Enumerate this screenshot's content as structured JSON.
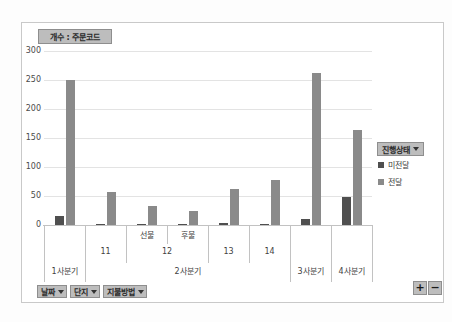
{
  "colors": {
    "undelivered": "#4f4f4f",
    "delivered": "#8a8a8a",
    "button_bg": "#bdbdbd",
    "button_border": "#8e8e8e",
    "gridline": "#e3e3e3",
    "axis_line": "#c2c2c2",
    "frame_border": "#c9c9c9"
  },
  "value_field_button": {
    "label": "개수 : 주문코드"
  },
  "chart_data": {
    "type": "bar",
    "title": "개수 : 주문코드",
    "xlabel": "",
    "ylabel": "",
    "ylim": [
      0,
      300
    ],
    "yticks": [
      300,
      250,
      200,
      150,
      100,
      50,
      0
    ],
    "grid": true,
    "legend_position": "right",
    "categories": [
      "1사분기",
      "11",
      "선불",
      "후불",
      "13",
      "14",
      "3사분기",
      "4사분기"
    ],
    "series": [
      {
        "name": "미전달",
        "color_key": "undelivered",
        "values": [
          15,
          1,
          2,
          1,
          4,
          1,
          10,
          48
        ]
      },
      {
        "name": "전달",
        "color_key": "delivered",
        "values": [
          250,
          57,
          33,
          24,
          62,
          77,
          262,
          163
        ]
      }
    ],
    "axis_hierarchy": {
      "payment_row": [
        {
          "label": "선불",
          "start": 2,
          "span": 1
        },
        {
          "label": "후불",
          "start": 3,
          "span": 1
        }
      ],
      "complex_row": [
        {
          "label": "11",
          "start": 1,
          "span": 1
        },
        {
          "label": "12",
          "start": 2,
          "span": 2
        },
        {
          "label": "13",
          "start": 4,
          "span": 1
        },
        {
          "label": "14",
          "start": 5,
          "span": 1
        }
      ],
      "quarter_row": [
        {
          "label": "1사분기",
          "start": 0,
          "span": 1
        },
        {
          "label": "2사분기",
          "start": 1,
          "span": 5
        },
        {
          "label": "3사분기",
          "start": 6,
          "span": 1
        },
        {
          "label": "4사분기",
          "start": 7,
          "span": 1
        }
      ]
    }
  },
  "legend": {
    "field_button_label": "진행상태",
    "items": [
      {
        "label": "미전달",
        "color_key": "undelivered"
      },
      {
        "label": "전달",
        "color_key": "delivered"
      }
    ]
  },
  "axis_field_buttons": [
    {
      "label": "날짜"
    },
    {
      "label": "단지"
    },
    {
      "label": "지불방법"
    }
  ],
  "expand_buttons": {
    "plus": "+",
    "minus": "−"
  }
}
